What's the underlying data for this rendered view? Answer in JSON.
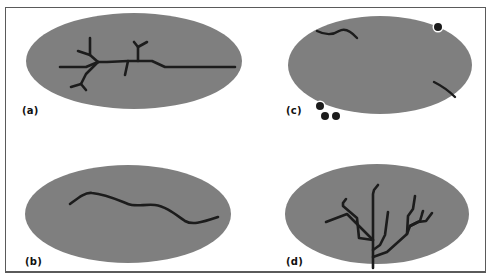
{
  "figure": {
    "colors": {
      "region_fill": "#7f7f7f",
      "stroke": "#1c1c1c",
      "frame_border": "#5a5a5a",
      "background": "#ffffff",
      "dot_halo": "#ffffff"
    },
    "panels": [
      {
        "id": "a",
        "label": "(a)",
        "description": "Branched network crossing the region and extending beyond its right edge"
      },
      {
        "id": "b",
        "label": "(b)",
        "description": "Single sinuous line crossing the region, exiting at right edge"
      },
      {
        "id": "c",
        "label": "(c)",
        "description": "Short isolated line segments near the region edge and dots on/outside the boundary"
      },
      {
        "id": "d",
        "label": "(d)",
        "description": "Tree-like dendritic branching network rooted at the bottom edge of the region"
      }
    ]
  }
}
